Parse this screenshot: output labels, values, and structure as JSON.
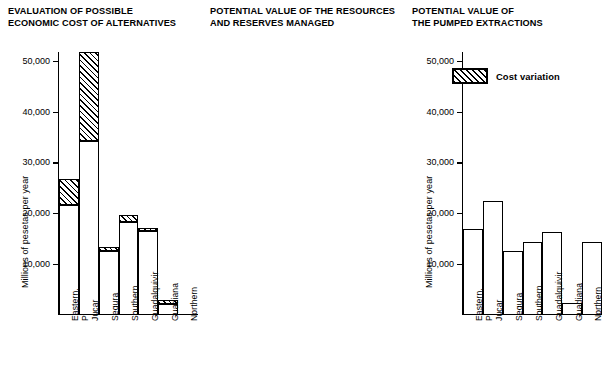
{
  "figure": {
    "ylabel": "Millions of pesetas per year",
    "categories": [
      "Eastern,\nPyrenees",
      "Jucar",
      "Segura",
      "Southern",
      "Guadalquivir",
      "Guadiana",
      "Northern"
    ],
    "yticks": [
      10000,
      20000,
      30000,
      40000,
      50000
    ],
    "ytick_labels": [
      "10,000",
      "20,000",
      "30,000",
      "40,000",
      "50,000"
    ],
    "ylim": [
      0,
      52500
    ],
    "legend": {
      "label": "Cost variation",
      "swatch": "hatched-box"
    }
  },
  "chart_data": [
    {
      "type": "bar",
      "title": "EVALUATION OF POSSIBLE\nECONOMIC COST OF ALTERNATIVES",
      "xlabel": "",
      "ylabel": "Millions of pesetas per year",
      "ylim": [
        0,
        52500
      ],
      "yticks": [
        10000,
        20000,
        30000,
        40000,
        50000
      ],
      "grid": false,
      "categories": [
        "Eastern,\nPyrenees",
        "Jucar",
        "Segura",
        "Southern",
        "Guadalquivir",
        "Guadiana",
        "Northern"
      ],
      "series": [
        {
          "name": "Base cost",
          "values": [
            21500,
            34000,
            12400,
            18000,
            16300,
            1900,
            0
          ]
        },
        {
          "name": "Cost variation",
          "values": [
            26500,
            51500,
            13200,
            19500,
            17000,
            2700,
            0
          ]
        }
      ]
    },
    {
      "type": "bar",
      "title": "POTENTIAL VALUE OF THE RESOURCES\nAND RESERVES MANAGED",
      "xlabel": "",
      "ylabel": "Millions of pesetas per year",
      "ylim": [
        0,
        52500
      ],
      "yticks": [
        10000,
        20000,
        30000,
        40000,
        50000
      ],
      "grid": false,
      "categories": [
        "Eastern,\nPyrenees",
        "Jucar",
        "Segura",
        "Southern",
        "Guadalquivir",
        "Guadiana",
        "Northern"
      ],
      "values": [
        16800,
        22300,
        12300,
        14200,
        16200,
        2200,
        14200
      ]
    },
    {
      "type": "bar",
      "title": "POTENTIAL VALUE OF\nTHE PUMPED EXTRACTIONS",
      "xlabel": "",
      "ylabel": "Millions of pesetas per year",
      "ylim": [
        0,
        52500
      ],
      "yticks": [
        10000,
        20000,
        30000,
        40000,
        50000
      ],
      "grid": false,
      "categories": [
        "Eastern,\nPyrenees",
        "Jucar",
        "Segura",
        "Southern",
        "Guadalquivir",
        "Guadiana",
        "Northern"
      ],
      "values": [
        10000,
        14200,
        6500,
        12800,
        6000,
        2100,
        0
      ]
    }
  ]
}
